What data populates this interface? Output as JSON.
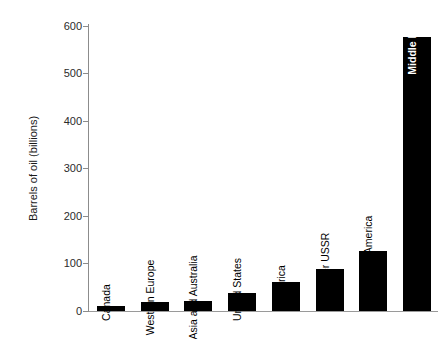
{
  "chart_data": {
    "type": "bar",
    "title": "",
    "xlabel": "",
    "ylabel": "Barrels of oil (billions)",
    "ylim": [
      0,
      600
    ],
    "yticks": [
      0,
      100,
      200,
      300,
      400,
      500,
      600
    ],
    "grid": false,
    "legend": "none",
    "categories": [
      "Canada",
      "Western Europe",
      "Asia and Australia",
      "United States",
      "Africa",
      "Former USSR",
      "Latin America",
      "Middle East"
    ],
    "values": [
      10,
      19,
      21,
      37,
      60,
      88,
      126,
      575
    ],
    "label_placement": [
      "above",
      "above",
      "above",
      "above",
      "above",
      "above",
      "above",
      "inside"
    ],
    "bar_color": "#000000",
    "inside_label_color": "#ffffff",
    "axis_color": "#8c8c8c",
    "text_color": "#1a1a1a"
  }
}
